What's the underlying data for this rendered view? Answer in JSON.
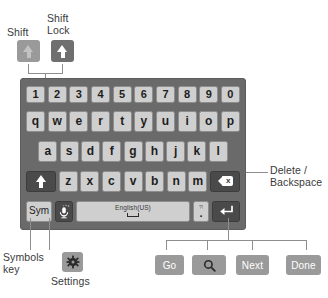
{
  "callouts": {
    "shift": "Shift",
    "shift_lock": "Shift\nLock",
    "delete_backspace": "Delete /\nBackspace",
    "symbols_key": "Symbols\nkey",
    "settings": "Settings"
  },
  "example_keys": {
    "shift": {
      "name": "shift-key",
      "state": "inactive",
      "glyph": "arrow-up-icon"
    },
    "shift_lock": {
      "name": "shift-lock-key",
      "state": "active",
      "glyph": "arrow-up-icon"
    },
    "settings": {
      "name": "settings-key",
      "glyph": "gear-icon"
    }
  },
  "enter_variants": [
    {
      "label": "Go",
      "icon": null,
      "name": "enter-variant-go"
    },
    {
      "label": "",
      "icon": "search-icon",
      "name": "enter-variant-search"
    },
    {
      "label": "Next",
      "icon": null,
      "name": "enter-variant-next"
    },
    {
      "label": "Done",
      "icon": null,
      "name": "enter-variant-done"
    }
  ],
  "keyboard": {
    "rows": {
      "numbers": [
        "1",
        "2",
        "3",
        "4",
        "5",
        "6",
        "7",
        "8",
        "9",
        "0"
      ],
      "top": [
        "q",
        "w",
        "e",
        "r",
        "t",
        "y",
        "u",
        "i",
        "o",
        "p"
      ],
      "home": [
        "a",
        "s",
        "d",
        "f",
        "g",
        "h",
        "j",
        "k",
        "l"
      ],
      "bottom": [
        "z",
        "x",
        "c",
        "v",
        "b",
        "n",
        "m"
      ]
    },
    "shift_key": {
      "glyph": "arrow-up-icon",
      "label": ""
    },
    "delete_key": {
      "glyph": "backspace-icon",
      "label": ""
    },
    "sym_key": {
      "label": "Sym"
    },
    "mic_key": {
      "glyph": "microphone-icon",
      "label": ""
    },
    "space_key": {
      "label": "English(US)",
      "glyph": "space-bracket-icon"
    },
    "period_key": {
      "top_label": "?!",
      "label": "."
    },
    "enter_key": {
      "glyph": "return-icon",
      "label": ""
    }
  },
  "colors": {
    "panel_bg": "#6a6a6a",
    "key_light": "#cfcfcf",
    "key_dark": "#4a4a4a",
    "example_light": "#9a9a9a",
    "example_dark": "#6f6f6f",
    "line": "#8e8e8e",
    "text": "#3a3a3a"
  }
}
